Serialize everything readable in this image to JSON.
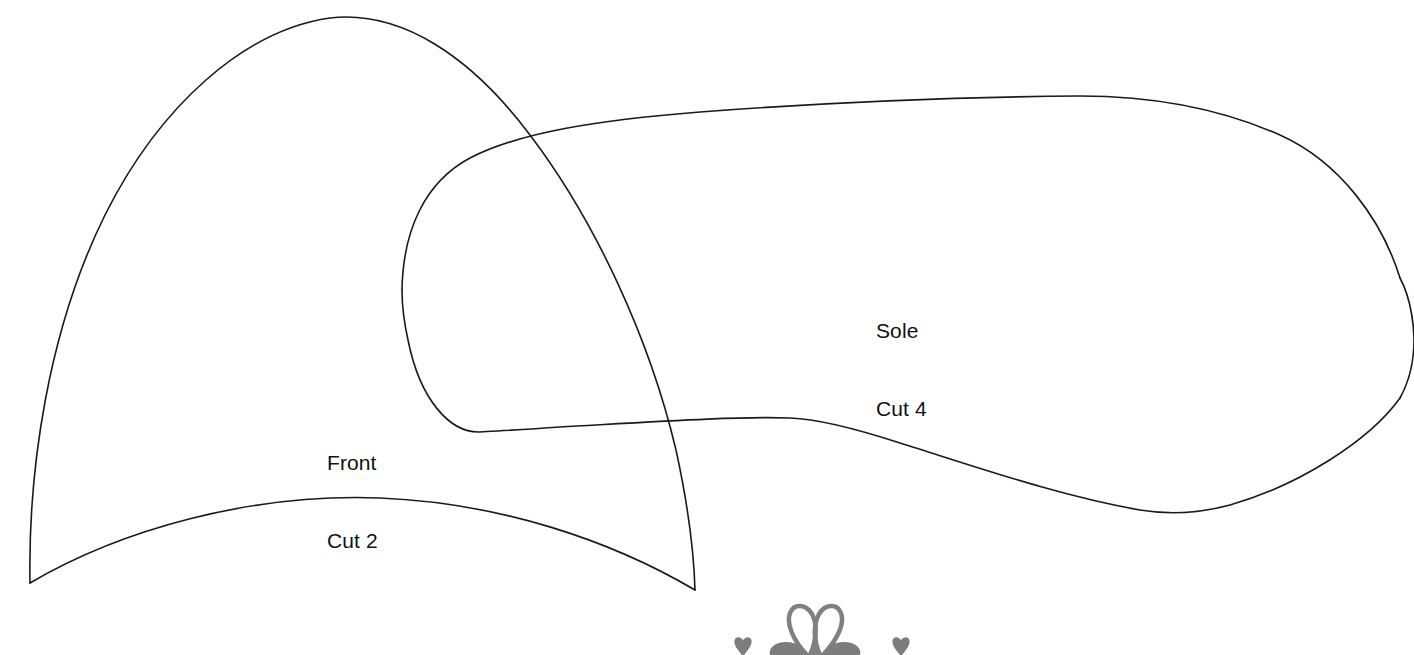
{
  "document": {
    "type": "sewing-pattern-sheet",
    "background_color": "#ffffff",
    "outline_color": "#1a1a1a",
    "flourish_color": "#808080",
    "width": 1414,
    "height": 655
  },
  "pieces": [
    {
      "id": "front",
      "name_line1": "Front",
      "name_line2": "Cut 2",
      "label_x": 327,
      "label_y": 398
    },
    {
      "id": "sole",
      "name_line1": "Sole",
      "name_line2": "Cut 4",
      "label_x": 876,
      "label_y": 266
    }
  ],
  "ornament": {
    "name": "floral-flourish",
    "position": "bottom-center",
    "color": "#808080"
  }
}
